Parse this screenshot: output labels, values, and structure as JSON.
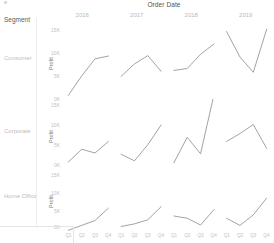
{
  "header": {
    "column_field_title": "Order Date",
    "row_field_title": "Segment",
    "years": [
      "2016",
      "2017",
      "2018",
      "2019"
    ]
  },
  "axis": {
    "y_title": "Profit",
    "y_ticks": [
      "15K",
      "10K",
      "5K",
      "0K"
    ],
    "x_ticks": [
      "Q1",
      "Q2",
      "Q3",
      "Q4"
    ]
  },
  "rows": [
    {
      "label": "Consumer"
    },
    {
      "label": "Corporate"
    },
    {
      "label": "Home Office"
    }
  ],
  "colors": {
    "line": "#8b8b8b",
    "tick_text": "#c2c2c2",
    "header_text": "#4f4f4f",
    "grid": "#ededed"
  },
  "chart_data": {
    "type": "line",
    "title": "Order Date",
    "xlabel": "Order Date (Quarter of Year)",
    "ylabel": "Profit",
    "grid": false,
    "legend": "none",
    "layout": "small-multiples grid: rows = Segment, columns = Year of Order Date",
    "row_field": "Segment",
    "column_field": "Order Date",
    "columns": [
      "2016",
      "2017",
      "2018",
      "2019"
    ],
    "x": [
      "Q1",
      "Q2",
      "Q3",
      "Q4"
    ],
    "ylim": [
      0,
      16000
    ],
    "yticks": [
      0,
      5000,
      10000,
      15000
    ],
    "ytick_labels": [
      "0K",
      "5K",
      "10K",
      "15K"
    ],
    "panels": [
      {
        "row": "Consumer",
        "series": [
          {
            "name": "2016",
            "values": [
              1000,
              5200,
              8900,
              9500
            ]
          },
          {
            "name": "2017",
            "values": [
              5100,
              7800,
              9600,
              6200
            ]
          },
          {
            "name": "2018",
            "values": [
              6400,
              6800,
              9900,
              12100
            ]
          },
          {
            "name": "2019",
            "values": [
              14800,
              9300,
              6000,
              15300
            ]
          }
        ]
      },
      {
        "row": "Corporate",
        "series": [
          {
            "name": "2016",
            "values": [
              1200,
              4300,
              3400,
              6200
            ]
          },
          {
            "name": "2017",
            "values": [
              3100,
              1500,
              5400,
              10200
            ]
          },
          {
            "name": "2018",
            "values": [
              1000,
              7200,
              3200,
              17500
            ]
          },
          {
            "name": "2019",
            "values": [
              6200,
              8100,
              10300,
              4500
            ]
          }
        ]
      },
      {
        "row": "Home Office",
        "series": [
          {
            "name": "2016",
            "values": [
              200,
              1500,
              2800,
              6100
            ]
          },
          {
            "name": "2017",
            "values": [
              1200,
              1900,
              3000,
              6500
            ]
          },
          {
            "name": "2018",
            "values": [
              4000,
              3400,
              1600,
              5700
            ]
          },
          {
            "name": "2019",
            "values": [
              3400,
              1500,
              4300,
              8800
            ]
          }
        ]
      }
    ]
  }
}
